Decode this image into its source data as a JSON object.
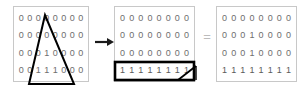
{
  "figure": {
    "background_color": "#ffffff",
    "panel_border_color": "#c8c8c8",
    "digit_color": "#6e6e6e",
    "shape_stroke_color": "#000000",
    "arrow_color": "#1a1a1a",
    "equals_color": "#bcbcbc"
  },
  "operator_arrow": {
    "glyph": "right-arrow",
    "label": "→"
  },
  "operator_equals": {
    "glyph": "equals",
    "label": "="
  },
  "matrices": [
    {
      "id": "matrix-source",
      "columns": 8,
      "rows": [
        [
          "0",
          "0",
          "0",
          "0",
          "0",
          "0",
          "0",
          "0"
        ],
        [
          "0",
          "0",
          "0",
          "0",
          "0",
          "0",
          "0",
          "0"
        ],
        [
          "0",
          "0",
          "0",
          "1",
          "0",
          "0",
          "0",
          "0"
        ],
        [
          "0",
          "0",
          "1",
          "1",
          "1",
          "0",
          "0",
          "0"
        ]
      ],
      "overlay_shape": "triangle"
    },
    {
      "id": "matrix-intermediate",
      "columns": 8,
      "rows": [
        [
          "0",
          "0",
          "0",
          "0",
          "0",
          "0",
          "0",
          "0"
        ],
        [
          "0",
          "0",
          "0",
          "0",
          "0",
          "0",
          "0",
          "0"
        ],
        [
          "0",
          "0",
          "0",
          "0",
          "0",
          "0",
          "0",
          "0"
        ],
        [
          "1",
          "1",
          "1",
          "1",
          "1",
          "1",
          "1",
          "1"
        ]
      ],
      "overlay_shape": "degenerate-triangle-box"
    },
    {
      "id": "matrix-result",
      "columns": 8,
      "rows": [
        [
          "0",
          "0",
          "0",
          "0",
          "0",
          "0",
          "0",
          "0"
        ],
        [
          "0",
          "0",
          "0",
          "1",
          "0",
          "0",
          "0",
          "0"
        ],
        [
          "0",
          "0",
          "0",
          "1",
          "0",
          "0",
          "0",
          "0"
        ],
        [
          "1",
          "1",
          "1",
          "1",
          "1",
          "1",
          "1",
          "1"
        ]
      ],
      "overlay_shape": "none"
    }
  ]
}
